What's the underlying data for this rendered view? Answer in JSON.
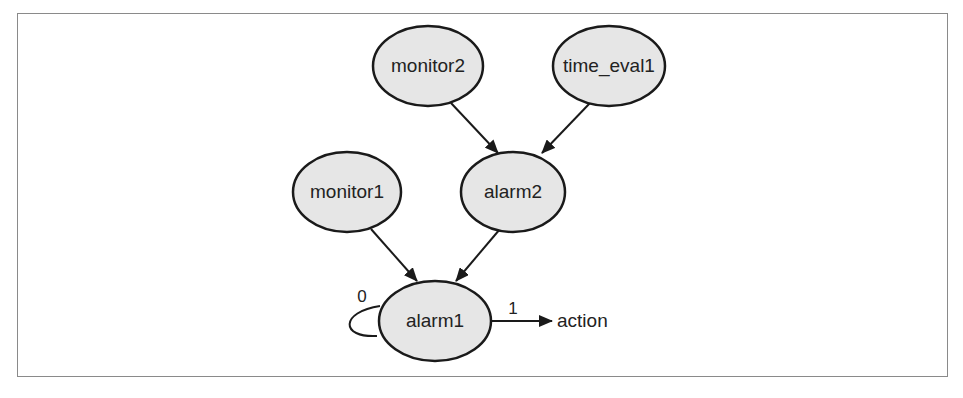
{
  "diagram": {
    "type": "directed-graph",
    "nodes": [
      {
        "id": "monitor2",
        "label": "monitor2"
      },
      {
        "id": "time_eval1",
        "label": "time_eval1"
      },
      {
        "id": "monitor1",
        "label": "monitor1"
      },
      {
        "id": "alarm2",
        "label": "alarm2"
      },
      {
        "id": "alarm1",
        "label": "alarm1"
      }
    ],
    "terminal": {
      "id": "action",
      "label": "action"
    },
    "edges": [
      {
        "from": "monitor2",
        "to": "alarm2",
        "label": ""
      },
      {
        "from": "time_eval1",
        "to": "alarm2",
        "label": ""
      },
      {
        "from": "monitor1",
        "to": "alarm1",
        "label": ""
      },
      {
        "from": "alarm2",
        "to": "alarm1",
        "label": ""
      },
      {
        "from": "alarm1",
        "to": "alarm1",
        "label": "0"
      },
      {
        "from": "alarm1",
        "to": "action",
        "label": "1"
      }
    ],
    "colors": {
      "node_fill": "#e6e6e6",
      "stroke": "#1a1a1a",
      "frame": "#8a8a8a"
    }
  }
}
